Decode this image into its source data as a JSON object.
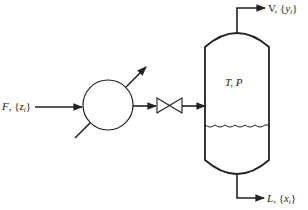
{
  "diagram": {
    "type": "flash-drum-process-flow",
    "colors": {
      "stroke": "#222222",
      "background": "#ffffff"
    },
    "feed": {
      "symbol": "F",
      "composition": "z",
      "subscript": "i"
    },
    "vapor": {
      "symbol": "V",
      "composition": "y",
      "subscript": "i"
    },
    "liquid": {
      "symbol": "L",
      "composition": "x",
      "subscript": "i"
    },
    "drum_conditions": "T, P",
    "equipment": [
      "heat-exchanger",
      "valve",
      "flash-drum"
    ]
  }
}
